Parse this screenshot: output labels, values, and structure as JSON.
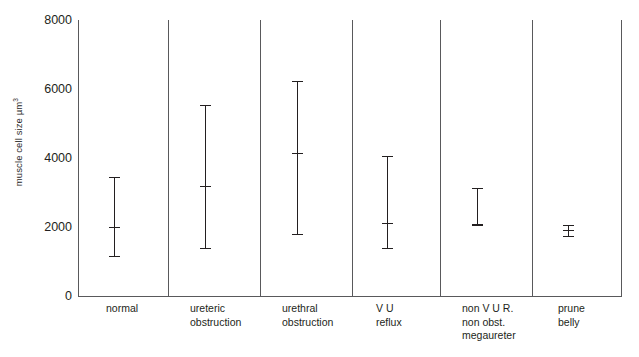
{
  "chart_data": {
    "type": "scatter",
    "title": "",
    "xlabel": "",
    "ylabel": "muscle cell size µm",
    "ylabel_superscript": "3",
    "ylim": [
      0,
      8000
    ],
    "yticks": [
      8000,
      6000,
      4000,
      2000,
      0
    ],
    "ytick_labels": [
      "8000",
      "6000",
      "4000",
      "2000",
      "0"
    ],
    "grid": false,
    "legend": "none",
    "panel_dividers": true,
    "categories": [
      "normal",
      "ureteric\nobstruction",
      "urethral\nobstruction",
      "V U\nreflux",
      "non V U R.\nnon obst.\nmegaureter",
      "prune\nbelly"
    ],
    "series": [
      {
        "name": "muscle cell size",
        "marker": "mean with range bars",
        "values": [
          2000,
          3200,
          4150,
          2120,
          2090,
          1900
        ],
        "upper": [
          3450,
          5550,
          6220,
          4050,
          3130,
          2050
        ],
        "lower": [
          1150,
          1400,
          1800,
          1400,
          2050,
          1750
        ]
      }
    ],
    "points": [
      {
        "category": "normal",
        "mean": 2000,
        "upper": 3450,
        "lower": 1150
      },
      {
        "category": "ureteric obstruction",
        "mean": 3200,
        "upper": 5550,
        "lower": 1400
      },
      {
        "category": "urethral obstruction",
        "mean": 4150,
        "upper": 6220,
        "lower": 1800
      },
      {
        "category": "V U reflux",
        "mean": 2120,
        "upper": 4050,
        "lower": 1400
      },
      {
        "category": "non V U R. non obst. megaureter",
        "mean": 2090,
        "upper": 3130,
        "lower": 2050
      },
      {
        "category": "prune belly",
        "mean": 1900,
        "upper": 2050,
        "lower": 1750
      }
    ],
    "colors": {
      "axis": "#59595b",
      "marker": "#231f20",
      "background": "#ffffff"
    }
  }
}
